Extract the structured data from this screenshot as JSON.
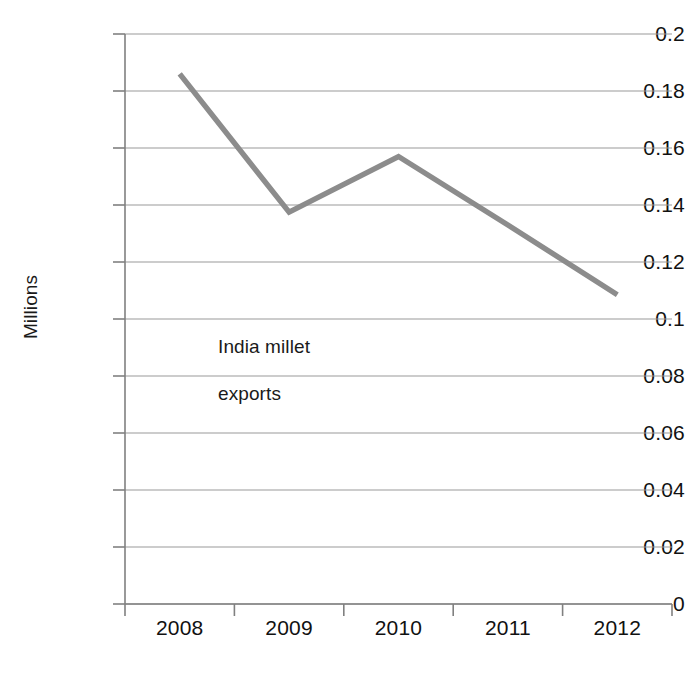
{
  "chart_data": {
    "type": "line",
    "title": "",
    "subtitle": "",
    "xlabel": "",
    "ylabel": "Millions",
    "categories": [
      "2008",
      "2009",
      "2010",
      "2011",
      "2012"
    ],
    "series": [
      {
        "name": "India millet exports",
        "values": [
          0.186,
          0.1375,
          0.157,
          0.133,
          0.1085
        ],
        "color": "#8c8c8c"
      }
    ],
    "ylim": [
      0,
      0.2
    ],
    "ytick_labels": [
      "0.2",
      "0.18",
      "0.16",
      "0.14",
      "0.12",
      "0.1",
      "0.08",
      "0.06",
      "0.04",
      "0.02",
      "0"
    ],
    "ytick_values": [
      0.2,
      0.18,
      0.16,
      0.14,
      0.12,
      0.1,
      0.08,
      0.06,
      0.04,
      0.02,
      0
    ],
    "grid": true,
    "grid_axis": "y",
    "legend_position": "none",
    "annotations": [
      {
        "text": "India millet",
        "name": "annotation-line-1"
      },
      {
        "text": "exports",
        "name": "annotation-line-2"
      }
    ],
    "markers": false
  },
  "colors": {
    "series_line": "#8c8c8c",
    "gridline": "#9a9a9a",
    "axis": "#808080",
    "text": "#111111",
    "background": "#ffffff"
  }
}
